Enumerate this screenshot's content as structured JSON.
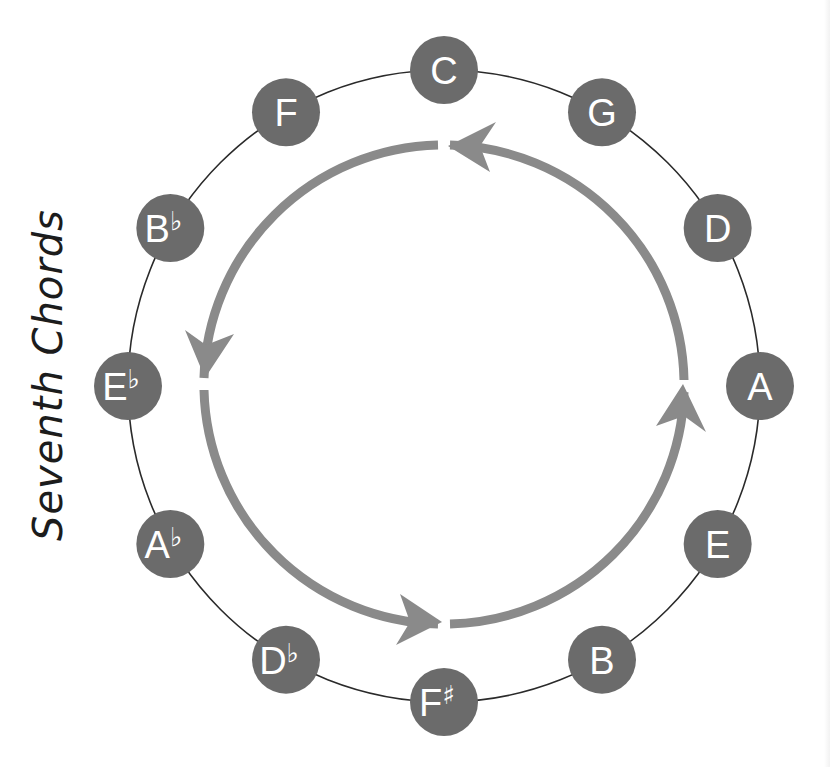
{
  "title": "Seventh Chords",
  "colors": {
    "node_fill": "#6b6b6b",
    "arrow": "#8a8a8a",
    "ring": "#2a2a2a",
    "label": "#ffffff",
    "title": "#1c1c1c"
  },
  "circle": {
    "direction": "counterclockwise",
    "nodes": [
      {
        "note": "C",
        "accidental": ""
      },
      {
        "note": "G",
        "accidental": ""
      },
      {
        "note": "D",
        "accidental": ""
      },
      {
        "note": "A",
        "accidental": ""
      },
      {
        "note": "E",
        "accidental": ""
      },
      {
        "note": "B",
        "accidental": ""
      },
      {
        "note": "F",
        "accidental": "♯"
      },
      {
        "note": "D",
        "accidental": "♭"
      },
      {
        "note": "A",
        "accidental": "♭"
      },
      {
        "note": "E",
        "accidental": "♭"
      },
      {
        "note": "B",
        "accidental": "♭"
      },
      {
        "note": "F",
        "accidental": ""
      }
    ]
  }
}
